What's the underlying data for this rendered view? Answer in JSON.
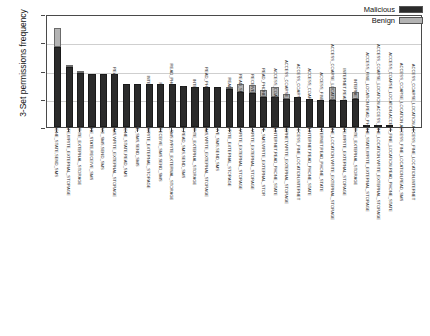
{
  "chart_data": {
    "type": "bar",
    "stacked": true,
    "title": "",
    "xlabel": "",
    "ylabel": "3-Set permissions frequency",
    "ylim": [
      0,
      1
    ],
    "yticks": [
      "0",
      "0.25",
      "0.5",
      "0.75",
      "1"
    ],
    "grid": true,
    "legend_position": "top-right",
    "legend": [
      "Malicious",
      "Benign"
    ],
    "colors": {
      "malicious": "#2b2b2b",
      "benign": "#b3b3b3",
      "grid": "#cfcfcf",
      "axis": "#4a4a4a"
    },
    "categories": [
      "INTERNET,READ_PHONE_STATE,SEND_SMS",
      "INTERNET,READ_PHONE_STATE,WRITE_EXTERNAL_STORAGE",
      "INTERNET,SEND_SMS,WRITE_EXTERNAL_STORAGE",
      "INTERNET,READ_PHONE_STATE,RECEIVE_SMS",
      "INTERNET,RECEIVE_SMS,SEND_SMS",
      "READ_PHONE_STATE,SEND_SMS,WRITE_EXTERNAL_STORAGE",
      "INTERNET,READ_PHONE_STATE,READ_SMS",
      "INTERNET,READ_SMS,SEND_SMS",
      "INTERNET,RECEIVE_SMS,WRITE_EXTERNAL_STORAGE",
      "READ_PHONE_STATE,RECEIVE_SMS,SEND_SMS",
      "READ_PHONE_STATE,RECEIVE_SMS,WRITE_EXTERNAL_STORAGE",
      "READ_PHONE_STATE,READ_SMS,SEND_SMS",
      "INTERNET,READ_SMS,WRITE_EXTERNAL_STORAGE",
      "READ_PHONE_STATE,READ_SMS,WRITE_EXTERNAL_STORAGE",
      "READ_SMS,RECEIVE_SMS,SEND_SMS",
      "READ_SMS,SEND_SMS,WRITE_EXTERNAL_STORAGE",
      "READ_SMS,RECEIVE_SMS,WRITE_EXTERNAL_STORAGE",
      "RECEIVE_SMS,SEND_SMS,WRITE_EXTERNAL_STORAGE",
      "READ_PHONE_STATE,RECEIVE_SMS,WRITE_EXTERNAL_STOR",
      "ACCESS_COARSE_LOCATION,INTERNET,READ_PHONE_STATE",
      "ACCESS_COARSE_LOCATION,INTERNET,WRITE_EXTERNAL_STORAGE",
      "ACCESS_COARSE_LOCATION,ACCESS_FINE_LOCATION,INTERNET",
      "ACCESS_COARSE_LOCATION,INTERNET,READ_PHONE_STATE",
      "ACCESS_FINE_LOCATION,INTERNET,READ_PHONE_STATE",
      "ACCESS_COARSE_LOCATION,ACCESS_FINE_LOCATION,WRITE_EXTERNAL_STORAGE",
      "INTERNET,READ_PHONE_STATE,WRITE_EXTERNAL_STORAGE",
      "INTERNET,READ_SMS,WRITE_EXTERNAL_STORAGE",
      "ACCESS_FINE_LOCATION,READ_PHONE_STATE,WRITE_EXTERNAL_STORAGE",
      "ACCESS_COARSE_LOCATION,ACCESS_FINE_LOCATION,WRITE_EXTERNAL_STORAGE",
      "ACCESS_COARSE_LOCATION,ACCESS_FINE_LOCATION,READ_PHONE_STATE",
      "ACCESS_COARSE_LOCATION,ACCESS_FINE_LOCATION,READ_SMS",
      "ACCESS_COARSE_LOCATION,ACCESS_FINE_LOCATION,INTERNET"
    ],
    "series": [
      {
        "name": "Malicious",
        "values": [
          0.71,
          0.53,
          0.48,
          0.47,
          0.47,
          0.47,
          0.38,
          0.38,
          0.38,
          0.38,
          0.38,
          0.36,
          0.35,
          0.35,
          0.35,
          0.34,
          0.31,
          0.3,
          0.27,
          0.27,
          0.25,
          0.27,
          0.25,
          0.24,
          0.24,
          0.24,
          0.25,
          0.02,
          0.01,
          0.01,
          0.0,
          0.0
        ]
      },
      {
        "name": "Benign",
        "values": [
          0.17,
          0.02,
          0.01,
          0.0,
          0.0,
          0.0,
          0.0,
          0.0,
          0.0,
          0.0,
          0.0,
          0.0,
          0.0,
          0.0,
          0.0,
          0.01,
          0.07,
          0.07,
          0.06,
          0.08,
          0.04,
          0.0,
          0.0,
          0.0,
          0.11,
          0.0,
          0.06,
          0.0,
          0.0,
          0.0,
          0.0,
          0.0
        ]
      }
    ]
  }
}
